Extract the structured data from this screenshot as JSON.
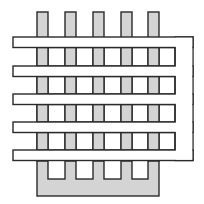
{
  "diagram": {
    "title": "Interdigitated serpentine electrode structure",
    "colors": {
      "background": "#ffffff",
      "finger_fill": "#d4d4d4",
      "serpentine_fill": "#ffffff",
      "stroke": "#2a2a2a"
    },
    "comb": {
      "finger_count": 5,
      "finger_x": [
        37,
        65,
        93,
        121,
        148
      ],
      "finger_width": 11,
      "finger_top": 12,
      "base_top": 161,
      "base_bottom": 196,
      "base_left": 37,
      "base_right": 159,
      "slot_bottom": 179
    },
    "serpentine": {
      "bar_count": 5,
      "bar_y": [
        37,
        66,
        94,
        122,
        150
      ],
      "bar_height": 10.5,
      "left_x": 13,
      "frame_right": 193,
      "inner_right": 175,
      "cells_left": 37
    }
  }
}
